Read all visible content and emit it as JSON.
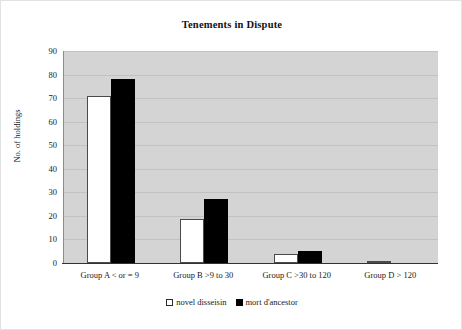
{
  "chart_data": {
    "type": "bar",
    "title": "Tenements in Dispute",
    "xlabel": "",
    "ylabel": "No. of holdings",
    "ylim": [
      0,
      90
    ],
    "ytick_step": 10,
    "yticks": [
      90,
      80,
      70,
      60,
      50,
      40,
      30,
      20,
      10,
      0
    ],
    "grid": true,
    "legend_position": "bottom-center",
    "plot_background": "#d4d4d4",
    "categories": [
      "Group A < or = 9",
      "Group B >9 to 30",
      "Group C >30 to 120",
      "Group D > 120"
    ],
    "series": [
      {
        "name": "novel disseisin",
        "color": "#ffffff",
        "edge_color": "#4a4a4a",
        "swatch": "open-square",
        "values": [
          71,
          18.5,
          4,
          1
        ]
      },
      {
        "name": "mort d'ancestor",
        "color": "#000000",
        "edge_color": "#000000",
        "swatch": "filled-square",
        "values": [
          78,
          27,
          5,
          0
        ]
      }
    ]
  },
  "legend": {
    "entries": [
      {
        "label": "novel disseisin"
      },
      {
        "label": "mort d'ancestor"
      }
    ]
  }
}
